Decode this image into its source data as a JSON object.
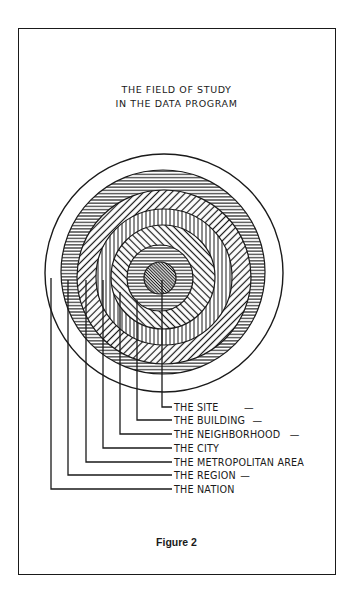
{
  "title": {
    "line1": "THE FIELD OF STUDY",
    "line2": "IN THE DATA PROGRAM"
  },
  "caption": "Figure 2",
  "rings": [
    {
      "key": "nation",
      "label": "THE NATION",
      "pattern": "blank",
      "cx": 164,
      "cy": 273,
      "r": 119,
      "leader_x": 51,
      "label_y": 489,
      "dash": ""
    },
    {
      "key": "region",
      "label": "THE REGION",
      "pattern": "horizontal",
      "cx": 163,
      "cy": 272,
      "r": 102,
      "leader_x": 68,
      "label_y": 475,
      "dash": "—"
    },
    {
      "key": "metro",
      "label": "THE METROPOLITAN AREA",
      "pattern": "diagonal-backslash",
      "cx": 164,
      "cy": 277,
      "r": 87,
      "leader_x": 86,
      "label_y": 462,
      "dash": ""
    },
    {
      "key": "city",
      "label": "THE CITY",
      "pattern": "vertical",
      "cx": 164,
      "cy": 277,
      "r": 68,
      "leader_x": 103,
      "label_y": 448,
      "dash": ""
    },
    {
      "key": "neighborhood",
      "label": "THE NEIGHBORHOOD",
      "pattern": "diagonal-slash",
      "cx": 163,
      "cy": 277,
      "r": 52,
      "leader_x": 120,
      "label_y": 434,
      "dash": "—"
    },
    {
      "key": "building",
      "label": "THE BUILDING",
      "pattern": "horizontal",
      "cx": 160,
      "cy": 278,
      "r": 33,
      "leader_x": 137,
      "label_y": 420,
      "dash": "—"
    },
    {
      "key": "site",
      "label": "THE SITE",
      "pattern": "dense-diagonal",
      "cx": 160,
      "cy": 278,
      "r": 16,
      "leader_x": 162,
      "label_y": 407,
      "dash": "—"
    }
  ],
  "colors": {
    "ink": "#1a1a1a",
    "paper": "#ffffff",
    "site_fill": "#bdbdbd"
  }
}
